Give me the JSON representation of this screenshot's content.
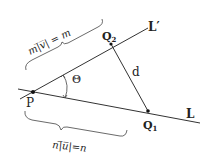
{
  "diagram": {
    "type": "geometry",
    "points": {
      "P": {
        "label": "P"
      },
      "Q1": {
        "label": "Q",
        "sub": "1"
      },
      "Q2": {
        "label": "Q",
        "sub": "2"
      }
    },
    "lines": {
      "L": {
        "label": "L"
      },
      "L_prime": {
        "label": "L′"
      }
    },
    "segment_label": "d",
    "angle_label": "Θ",
    "brace_upper": {
      "text": "m|̅v̅| = m"
    },
    "brace_lower": {
      "text": "n|̅u̅|=n"
    }
  }
}
